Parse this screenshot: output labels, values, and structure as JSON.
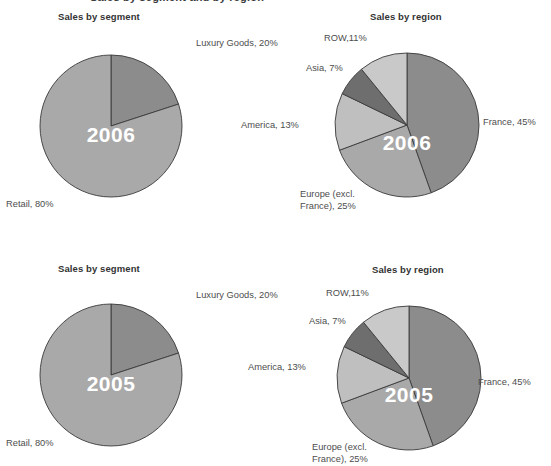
{
  "document": {
    "cut_off_header": "Sales by segment and by region"
  },
  "chart_data": [
    {
      "id": "segment-2006",
      "type": "pie",
      "title": "Sales by segment",
      "center_label": "2006",
      "start_angle_deg": 0,
      "labels": [
        "Luxury Goods, 20%",
        "Retail, 80%"
      ],
      "categories": [
        "Luxury Goods",
        "Retail"
      ],
      "values": [
        20,
        80
      ],
      "colors": [
        "#8c8c8c",
        "#a9a9a9"
      ],
      "legend": "none",
      "grid": false,
      "label_positions": [
        {
          "x": 196,
          "y": 38,
          "align": "left"
        },
        {
          "x": 6,
          "y": 199,
          "align": "left"
        }
      ]
    },
    {
      "id": "region-2006",
      "type": "pie",
      "title": "Sales by region",
      "center_label": "2006",
      "start_angle_deg": 0,
      "labels": [
        "France, 45%",
        "Europe (excl.\nFrance), 25%",
        "America, 13%",
        "Asia, 7%",
        "ROW,11%"
      ],
      "categories": [
        "France",
        "Europe (excl. France)",
        "America",
        "Asia",
        "ROW"
      ],
      "values": [
        45,
        25,
        13,
        7,
        11
      ],
      "colors": [
        "#8c8c8c",
        "#a9a9a9",
        "#bfbfbf",
        "#6e6e6e",
        "#c9c9c9"
      ],
      "legend": "none",
      "grid": false,
      "label_positions": [
        {
          "x": 483,
          "y": 117,
          "align": "left"
        },
        {
          "x": 300,
          "y": 189,
          "align": "left"
        },
        {
          "x": 241,
          "y": 120,
          "align": "left"
        },
        {
          "x": 306,
          "y": 63,
          "align": "left"
        },
        {
          "x": 324,
          "y": 33,
          "align": "left"
        }
      ]
    },
    {
      "id": "segment-2005",
      "type": "pie",
      "title": "Sales by segment",
      "center_label": "2005",
      "start_angle_deg": 0,
      "labels": [
        "Luxury Goods, 20%",
        "Retail, 80%"
      ],
      "categories": [
        "Luxury Goods",
        "Retail"
      ],
      "values": [
        20,
        80
      ],
      "colors": [
        "#8c8c8c",
        "#a9a9a9"
      ],
      "legend": "none",
      "grid": false,
      "label_positions": [
        {
          "x": 196,
          "y": 290,
          "align": "left"
        },
        {
          "x": 6,
          "y": 438,
          "align": "left"
        }
      ]
    },
    {
      "id": "region-2005",
      "type": "pie",
      "title": "Sales by region",
      "center_label": "2005",
      "start_angle_deg": 0,
      "labels": [
        "France, 45%",
        "Europe (excl.\nFrance), 25%",
        "America, 13%",
        "Asia, 7%",
        "ROW,11%"
      ],
      "categories": [
        "France",
        "Europe (excl. France)",
        "America",
        "Asia",
        "ROW"
      ],
      "values": [
        45,
        25,
        13,
        7,
        11
      ],
      "colors": [
        "#8c8c8c",
        "#a9a9a9",
        "#bfbfbf",
        "#6e6e6e",
        "#c9c9c9"
      ],
      "legend": "none",
      "grid": false,
      "label_positions": [
        {
          "x": 478,
          "y": 377,
          "align": "left"
        },
        {
          "x": 312,
          "y": 442,
          "align": "left"
        },
        {
          "x": 248,
          "y": 362,
          "align": "left"
        },
        {
          "x": 309,
          "y": 316,
          "align": "left"
        },
        {
          "x": 326,
          "y": 288,
          "align": "left"
        }
      ]
    }
  ],
  "panels": [
    {
      "title": "Sales by segment",
      "title_x": 58,
      "title_y": 11,
      "pie_cx": 111,
      "pie_cy": 126,
      "pie_r": 71,
      "year": "2006",
      "year_x": 111,
      "year_y": 136,
      "chart_index": 0
    },
    {
      "title": "Sales by region",
      "title_x": 370,
      "title_y": 11,
      "pie_cx": 407,
      "pie_cy": 125,
      "pie_r": 72,
      "year": "2006",
      "year_x": 407,
      "year_y": 144,
      "chart_index": 1
    },
    {
      "title": "Sales by segment",
      "title_x": 58,
      "title_y": 263,
      "pie_cx": 111,
      "pie_cy": 375,
      "pie_r": 71,
      "year": "2005",
      "year_x": 111,
      "year_y": 385,
      "chart_index": 2
    },
    {
      "title": "Sales by region",
      "title_x": 372,
      "title_y": 264,
      "pie_cx": 409,
      "pie_cy": 378,
      "pie_r": 72,
      "year": "2005",
      "year_x": 409,
      "year_y": 396,
      "chart_index": 3
    }
  ]
}
